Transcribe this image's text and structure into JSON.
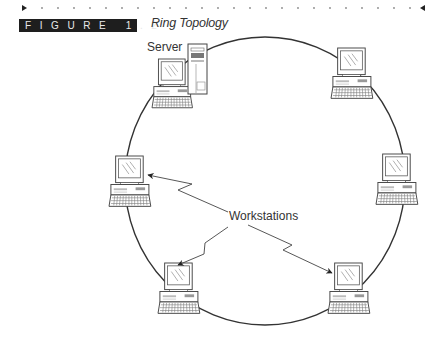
{
  "figure": {
    "label": "FIGURE 1.2",
    "title": "Ring Topology"
  },
  "diagram": {
    "type": "ring-topology",
    "labels": {
      "server": "Server",
      "workstations": "Workstations"
    },
    "nodes": [
      {
        "id": "server",
        "kind": "server+workstation",
        "label": "Server"
      },
      {
        "id": "ws-top-right",
        "kind": "workstation"
      },
      {
        "id": "ws-left",
        "kind": "workstation"
      },
      {
        "id": "ws-right",
        "kind": "workstation"
      },
      {
        "id": "ws-bottom-left",
        "kind": "workstation"
      },
      {
        "id": "ws-bottom-right",
        "kind": "workstation"
      }
    ],
    "callout_targets": [
      "ws-left",
      "ws-bottom-left",
      "ws-bottom-right"
    ],
    "colors": {
      "line": "#333333",
      "label_bg": "#1e1e1e",
      "label_text": "#e8e8e8"
    }
  }
}
